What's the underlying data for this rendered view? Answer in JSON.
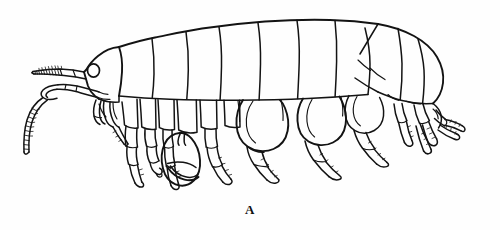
{
  "figure": {
    "label": "A",
    "caption_position": "bottom-center",
    "background_color": "#fefefe",
    "ink_color": "#131313",
    "width": 500,
    "height": 230,
    "orientation": "lateral view, anterior to the left",
    "technique": "pen-and-ink line drawing"
  },
  "anatomy": {
    "head": {
      "name": "head",
      "eye": "compound-eye",
      "eye_shape": "oval"
    },
    "antenna1": {
      "name": "antenna-1",
      "description": "upper antenna directed anteriorly with segmented flagellum"
    },
    "antenna2": {
      "name": "antenna-2",
      "description": "lower antenna curving downward with segmented flagellum"
    },
    "mouthparts": {
      "name": "mouthparts",
      "description": "maxillipeds and gnathopod bases beneath the head"
    },
    "pereon": {
      "name": "pereon",
      "segment_count": 7,
      "description": "seven pereonites with coxal plates"
    },
    "pleon": {
      "name": "pleon",
      "segment_count": 3,
      "description": "three pleonites with epimeral plates"
    },
    "urosome": {
      "name": "urosome",
      "segment_count": 3,
      "description": "terminal segments bearing uropods"
    },
    "gnathopod1": {
      "name": "gnathopod-1",
      "description": "first grasping appendage"
    },
    "gnathopod2": {
      "name": "gnathopod-2",
      "description": "enlarged subchelate second gnathopod with inflated propodus"
    },
    "pereopods": {
      "name": "pereopods",
      "count": 5,
      "description": "walking legs with setose margins"
    },
    "uropods": {
      "name": "uropods",
      "count": 3,
      "description": "posterior biramous appendages with spinose rami"
    },
    "telson": {
      "name": "telson",
      "description": "terminal plate at the rear of the urosome"
    }
  }
}
